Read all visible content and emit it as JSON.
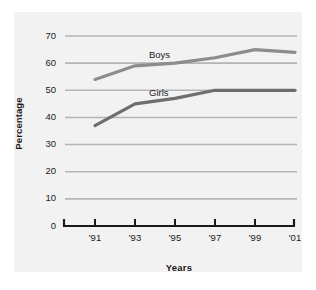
{
  "chart_data": {
    "type": "line",
    "title": "",
    "xlabel": "Years",
    "ylabel": "Percentage",
    "x": [
      "'91",
      "'93",
      "'95",
      "'97",
      "'99",
      "'01"
    ],
    "categories": [
      "'91",
      "'93",
      "'95",
      "'97",
      "'99",
      "'01"
    ],
    "series": [
      {
        "name": "Boys",
        "values": [
          54,
          59,
          60,
          62,
          65,
          64
        ],
        "color": "#8c8c8c"
      },
      {
        "name": "Girls",
        "values": [
          37,
          45,
          47,
          50,
          50,
          50
        ],
        "color": "#6e6e6e"
      }
    ],
    "ylim": [
      0,
      70
    ],
    "ytick_labels": [
      "0",
      "10",
      "20",
      "30",
      "40",
      "50",
      "60",
      "70"
    ],
    "ytick_values": [
      0,
      10,
      20,
      30,
      40,
      50,
      60,
      70
    ],
    "grid": true,
    "legend_position": "inline-labels",
    "annotations": [
      {
        "text": "Boys",
        "series": "Boys"
      },
      {
        "text": "Girls",
        "series": "Girls"
      }
    ]
  },
  "style": {
    "panel_background": "#f2f2f2",
    "page_background": "#ffffff",
    "gridline_color": "#b5b5b5",
    "axis_color": "#1a1a1a",
    "text_color": "#1a1a1a"
  }
}
